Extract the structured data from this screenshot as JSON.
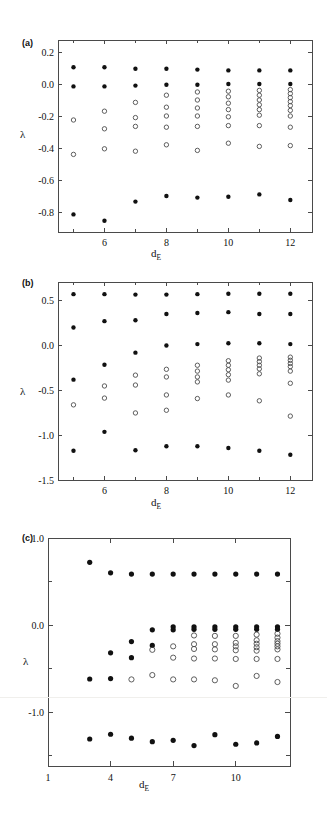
{
  "figure": {
    "caption_labels": {
      "a": "(a)",
      "b": "(b)",
      "c": "(c)"
    },
    "axis_label_lambda": "λ",
    "axis_label_de_main": "d",
    "axis_label_de_sub": "E",
    "marker_legend": {
      "filled": "true Lyapunov exponent",
      "open": "spurious Lyapunov exponent"
    },
    "colors": {
      "ink": "#111111",
      "axis": "#4a4a4a",
      "open_marker": "#4d4d4d",
      "background": "#ffffff"
    }
  },
  "chart_data": [
    {
      "id": "panel-a",
      "type": "scatter",
      "title": "(a)",
      "xlabel": "d_E",
      "ylabel": "λ",
      "xlim": [
        4.5,
        12.7
      ],
      "ylim": [
        -0.92,
        0.28
      ],
      "xticks": [
        6,
        8,
        10,
        12
      ],
      "xticklabels": [
        "6",
        "8",
        "10",
        "12"
      ],
      "xminorticks": [
        5,
        7,
        9,
        11
      ],
      "yticks": [
        0.2,
        0.0,
        -0.2,
        -0.4,
        -0.6,
        -0.8
      ],
      "yticklabels": [
        "0.2",
        "0.0",
        "-0.2",
        "-0.4",
        "-0.6",
        "-0.8"
      ],
      "grid": false,
      "legend": "none",
      "series": [
        {
          "name": "true exponents",
          "marker": "filled-circle",
          "points": [
            {
              "x": 5,
              "y": 0.11
            },
            {
              "x": 5,
              "y": -0.01
            },
            {
              "x": 5,
              "y": -0.81
            },
            {
              "x": 6,
              "y": 0.11
            },
            {
              "x": 6,
              "y": -0.01
            },
            {
              "x": 6,
              "y": -0.85
            },
            {
              "x": 7,
              "y": 0.1
            },
            {
              "x": 7,
              "y": -0.005
            },
            {
              "x": 7,
              "y": -0.73
            },
            {
              "x": 8,
              "y": 0.1
            },
            {
              "x": 8,
              "y": 0.0
            },
            {
              "x": 8,
              "y": -0.695
            },
            {
              "x": 9,
              "y": 0.095
            },
            {
              "x": 9,
              "y": 0.0
            },
            {
              "x": 9,
              "y": -0.705
            },
            {
              "x": 10,
              "y": 0.09
            },
            {
              "x": 10,
              "y": 0.005
            },
            {
              "x": 10,
              "y": -0.7
            },
            {
              "x": 11,
              "y": 0.09
            },
            {
              "x": 11,
              "y": 0.005
            },
            {
              "x": 11,
              "y": -0.685
            },
            {
              "x": 12,
              "y": 0.09
            },
            {
              "x": 12,
              "y": 0.005
            },
            {
              "x": 12,
              "y": -0.72
            }
          ]
        },
        {
          "name": "spurious exponents",
          "marker": "open-circle",
          "points": [
            {
              "x": 5,
              "y": -0.22
            },
            {
              "x": 5,
              "y": -0.435
            },
            {
              "x": 6,
              "y": -0.165
            },
            {
              "x": 6,
              "y": -0.275
            },
            {
              "x": 6,
              "y": -0.4
            },
            {
              "x": 7,
              "y": -0.11
            },
            {
              "x": 7,
              "y": -0.205
            },
            {
              "x": 7,
              "y": -0.26
            },
            {
              "x": 7,
              "y": -0.415
            },
            {
              "x": 8,
              "y": -0.065
            },
            {
              "x": 8,
              "y": -0.14
            },
            {
              "x": 8,
              "y": -0.195
            },
            {
              "x": 8,
              "y": -0.265
            },
            {
              "x": 8,
              "y": -0.375
            },
            {
              "x": 9,
              "y": -0.045
            },
            {
              "x": 9,
              "y": -0.095
            },
            {
              "x": 9,
              "y": -0.145
            },
            {
              "x": 9,
              "y": -0.195
            },
            {
              "x": 9,
              "y": -0.26
            },
            {
              "x": 9,
              "y": -0.41
            },
            {
              "x": 10,
              "y": -0.04
            },
            {
              "x": 10,
              "y": -0.075
            },
            {
              "x": 10,
              "y": -0.115
            },
            {
              "x": 10,
              "y": -0.155
            },
            {
              "x": 10,
              "y": -0.2
            },
            {
              "x": 10,
              "y": -0.255
            },
            {
              "x": 10,
              "y": -0.365
            },
            {
              "x": 11,
              "y": -0.035
            },
            {
              "x": 11,
              "y": -0.065
            },
            {
              "x": 11,
              "y": -0.095
            },
            {
              "x": 11,
              "y": -0.125
            },
            {
              "x": 11,
              "y": -0.155
            },
            {
              "x": 11,
              "y": -0.19
            },
            {
              "x": 11,
              "y": -0.255
            },
            {
              "x": 11,
              "y": -0.385
            },
            {
              "x": 12,
              "y": -0.03
            },
            {
              "x": 12,
              "y": -0.055
            },
            {
              "x": 12,
              "y": -0.08
            },
            {
              "x": 12,
              "y": -0.105
            },
            {
              "x": 12,
              "y": -0.13
            },
            {
              "x": 12,
              "y": -0.16
            },
            {
              "x": 12,
              "y": -0.195
            },
            {
              "x": 12,
              "y": -0.265
            },
            {
              "x": 12,
              "y": -0.38
            }
          ]
        }
      ]
    },
    {
      "id": "panel-b",
      "type": "scatter",
      "title": "(b)",
      "xlabel": "d_E",
      "ylabel": "λ",
      "xlim": [
        4.5,
        12.7
      ],
      "ylim": [
        -1.5,
        0.7
      ],
      "xticks": [
        6,
        8,
        10,
        12
      ],
      "xticklabels": [
        "6",
        "8",
        "10",
        "12"
      ],
      "xminorticks": [
        5,
        7,
        9,
        11
      ],
      "yticks": [
        0.5,
        0.0,
        -0.5,
        -1.0,
        -1.5
      ],
      "yticklabels": [
        "0.5",
        "0.0",
        "-0.5",
        "-1.0",
        "-1.5"
      ],
      "grid": false,
      "legend": "none",
      "series": [
        {
          "name": "true exponents",
          "marker": "filled-circle",
          "points": [
            {
              "x": 5,
              "y": 0.565
            },
            {
              "x": 5,
              "y": 0.195
            },
            {
              "x": 5,
              "y": -0.385
            },
            {
              "x": 5,
              "y": -1.175
            },
            {
              "x": 6,
              "y": 0.565
            },
            {
              "x": 6,
              "y": 0.265
            },
            {
              "x": 6,
              "y": -0.22
            },
            {
              "x": 6,
              "y": -0.965
            },
            {
              "x": 7,
              "y": 0.56
            },
            {
              "x": 7,
              "y": 0.275
            },
            {
              "x": 7,
              "y": -0.085
            },
            {
              "x": 7,
              "y": -1.17
            },
            {
              "x": 8,
              "y": 0.56
            },
            {
              "x": 8,
              "y": 0.345
            },
            {
              "x": 8,
              "y": -0.005
            },
            {
              "x": 8,
              "y": -1.125
            },
            {
              "x": 9,
              "y": 0.565
            },
            {
              "x": 9,
              "y": 0.355
            },
            {
              "x": 9,
              "y": 0.01
            },
            {
              "x": 9,
              "y": -1.125
            },
            {
              "x": 10,
              "y": 0.57
            },
            {
              "x": 10,
              "y": 0.365
            },
            {
              "x": 10,
              "y": 0.02
            },
            {
              "x": 10,
              "y": -1.145
            },
            {
              "x": 11,
              "y": 0.57
            },
            {
              "x": 11,
              "y": 0.345
            },
            {
              "x": 11,
              "y": 0.02
            },
            {
              "x": 11,
              "y": -1.175
            },
            {
              "x": 12,
              "y": 0.57
            },
            {
              "x": 12,
              "y": 0.345
            },
            {
              "x": 12,
              "y": 0.01
            },
            {
              "x": 12,
              "y": -1.22
            }
          ]
        },
        {
          "name": "spurious exponents",
          "marker": "open-circle",
          "points": [
            {
              "x": 5,
              "y": -0.665
            },
            {
              "x": 6,
              "y": -0.455
            },
            {
              "x": 6,
              "y": -0.59
            },
            {
              "x": 7,
              "y": -0.335
            },
            {
              "x": 7,
              "y": -0.445
            },
            {
              "x": 7,
              "y": -0.755
            },
            {
              "x": 8,
              "y": -0.27
            },
            {
              "x": 8,
              "y": -0.355
            },
            {
              "x": 8,
              "y": -0.555
            },
            {
              "x": 8,
              "y": -0.725
            },
            {
              "x": 9,
              "y": -0.225
            },
            {
              "x": 9,
              "y": -0.29
            },
            {
              "x": 9,
              "y": -0.355
            },
            {
              "x": 9,
              "y": -0.41
            },
            {
              "x": 9,
              "y": -0.595
            },
            {
              "x": 10,
              "y": -0.175
            },
            {
              "x": 10,
              "y": -0.225
            },
            {
              "x": 10,
              "y": -0.275
            },
            {
              "x": 10,
              "y": -0.33
            },
            {
              "x": 10,
              "y": -0.39
            },
            {
              "x": 10,
              "y": -0.555
            },
            {
              "x": 11,
              "y": -0.145
            },
            {
              "x": 11,
              "y": -0.185
            },
            {
              "x": 11,
              "y": -0.225
            },
            {
              "x": 11,
              "y": -0.265
            },
            {
              "x": 11,
              "y": -0.32
            },
            {
              "x": 11,
              "y": -0.62
            },
            {
              "x": 12,
              "y": -0.135
            },
            {
              "x": 12,
              "y": -0.17
            },
            {
              "x": 12,
              "y": -0.205
            },
            {
              "x": 12,
              "y": -0.24
            },
            {
              "x": 12,
              "y": -0.29
            },
            {
              "x": 12,
              "y": -0.425
            },
            {
              "x": 12,
              "y": -0.79
            }
          ]
        }
      ]
    },
    {
      "id": "panel-c",
      "type": "scatter",
      "title": "(c)",
      "xlabel": "d_E",
      "ylabel": "λ",
      "xlim": [
        1,
        12.6
      ],
      "ylim": [
        -1.62,
        1.0
      ],
      "xticks": [
        1,
        4,
        7,
        10
      ],
      "xticklabels": [
        "1",
        "4",
        "7",
        "10"
      ],
      "xminorticks": [],
      "yticks": [
        1.0,
        0.0,
        -1.0
      ],
      "yticklabels": [
        "1.0",
        "0.0",
        "-1.0"
      ],
      "yminorticks": [
        0.5,
        -0.5,
        -1.5
      ],
      "grid": false,
      "legend": "none",
      "series": [
        {
          "name": "true exponents",
          "marker": "filled-circle",
          "points": [
            {
              "x": 3,
              "y": 0.72
            },
            {
              "x": 3,
              "y": -0.62
            },
            {
              "x": 3,
              "y": -1.31
            },
            {
              "x": 4,
              "y": 0.6
            },
            {
              "x": 4,
              "y": -0.32
            },
            {
              "x": 4,
              "y": -0.615
            },
            {
              "x": 4,
              "y": -1.255
            },
            {
              "x": 5,
              "y": 0.585
            },
            {
              "x": 5,
              "y": -0.19
            },
            {
              "x": 5,
              "y": -0.375
            },
            {
              "x": 5,
              "y": -1.3
            },
            {
              "x": 6,
              "y": 0.585
            },
            {
              "x": 6,
              "y": -0.055
            },
            {
              "x": 6,
              "y": -0.235
            },
            {
              "x": 6,
              "y": -1.34
            },
            {
              "x": 7,
              "y": 0.585
            },
            {
              "x": 7,
              "y": -0.02
            },
            {
              "x": 7,
              "y": -0.055
            },
            {
              "x": 7,
              "y": -1.325
            },
            {
              "x": 8,
              "y": 0.585
            },
            {
              "x": 8,
              "y": -0.02
            },
            {
              "x": 8,
              "y": -0.05
            },
            {
              "x": 8,
              "y": -1.385
            },
            {
              "x": 9,
              "y": 0.585
            },
            {
              "x": 9,
              "y": -0.02
            },
            {
              "x": 9,
              "y": -0.05
            },
            {
              "x": 9,
              "y": -1.26
            },
            {
              "x": 10,
              "y": 0.585
            },
            {
              "x": 10,
              "y": -0.02
            },
            {
              "x": 10,
              "y": -0.05
            },
            {
              "x": 10,
              "y": -1.37
            },
            {
              "x": 11,
              "y": 0.585
            },
            {
              "x": 11,
              "y": -0.02
            },
            {
              "x": 11,
              "y": -0.05
            },
            {
              "x": 11,
              "y": -1.355
            },
            {
              "x": 12,
              "y": 0.585
            },
            {
              "x": 12,
              "y": -0.02
            },
            {
              "x": 12,
              "y": -0.05
            },
            {
              "x": 12,
              "y": -1.28
            }
          ]
        },
        {
          "name": "spurious exponents",
          "marker": "open-circle",
          "points": [
            {
              "x": 5,
              "y": -0.625
            },
            {
              "x": 6,
              "y": -0.285
            },
            {
              "x": 6,
              "y": -0.575
            },
            {
              "x": 7,
              "y": -0.245
            },
            {
              "x": 7,
              "y": -0.375
            },
            {
              "x": 7,
              "y": -0.625
            },
            {
              "x": 8,
              "y": -0.12
            },
            {
              "x": 8,
              "y": -0.22
            },
            {
              "x": 8,
              "y": -0.275
            },
            {
              "x": 8,
              "y": -0.385
            },
            {
              "x": 8,
              "y": -0.625
            },
            {
              "x": 9,
              "y": -0.125
            },
            {
              "x": 9,
              "y": -0.22
            },
            {
              "x": 9,
              "y": -0.28
            },
            {
              "x": 9,
              "y": -0.385
            },
            {
              "x": 9,
              "y": -0.635
            },
            {
              "x": 10,
              "y": -0.125
            },
            {
              "x": 10,
              "y": -0.205
            },
            {
              "x": 10,
              "y": -0.245
            },
            {
              "x": 10,
              "y": -0.29
            },
            {
              "x": 10,
              "y": -0.39
            },
            {
              "x": 10,
              "y": -0.7
            },
            {
              "x": 11,
              "y": -0.11
            },
            {
              "x": 11,
              "y": -0.175
            },
            {
              "x": 11,
              "y": -0.215
            },
            {
              "x": 11,
              "y": -0.255
            },
            {
              "x": 11,
              "y": -0.295
            },
            {
              "x": 11,
              "y": -0.39
            },
            {
              "x": 11,
              "y": -0.585
            },
            {
              "x": 12,
              "y": -0.1
            },
            {
              "x": 12,
              "y": -0.145
            },
            {
              "x": 12,
              "y": -0.185
            },
            {
              "x": 12,
              "y": -0.215
            },
            {
              "x": 12,
              "y": -0.245
            },
            {
              "x": 12,
              "y": -0.28
            },
            {
              "x": 12,
              "y": -0.39
            },
            {
              "x": 12,
              "y": -0.655
            }
          ]
        }
      ]
    }
  ]
}
